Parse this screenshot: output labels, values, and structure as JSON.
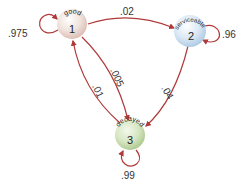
{
  "colors": {
    "edge": "#b03a3a",
    "node_good": "#ecd2cc",
    "node_serviceable": "#c9dcee",
    "node_decayed": "#cfe0b8"
  },
  "nodes": [
    {
      "id": "1",
      "name": "good",
      "number": "1"
    },
    {
      "id": "2",
      "name": "serviceable",
      "number": "2"
    },
    {
      "id": "3",
      "name": "decayed",
      "number": "3"
    }
  ],
  "edges": [
    {
      "from": "1",
      "to": "1",
      "label": ".975"
    },
    {
      "from": "1",
      "to": "2",
      "label": ".02"
    },
    {
      "from": "2",
      "to": "2",
      "label": ".96"
    },
    {
      "from": "2",
      "to": "3",
      "label": ".04"
    },
    {
      "from": "1",
      "to": "3",
      "label": ".005"
    },
    {
      "from": "3",
      "to": "1",
      "label": ".01"
    },
    {
      "from": "3",
      "to": "3",
      "label": ".99"
    }
  ]
}
